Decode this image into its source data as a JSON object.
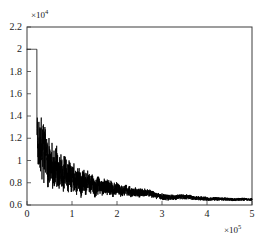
{
  "chart_data": {
    "type": "line",
    "title": "",
    "xlabel": "",
    "ylabel": "",
    "x_exponent_label": "×10",
    "x_exponent_power": "5",
    "y_exponent_label": "×10",
    "y_exponent_power": "4",
    "x_scale_factor": 100000,
    "y_scale_factor": 10000,
    "xlim": [
      0,
      5
    ],
    "ylim": [
      0.6,
      2.2
    ],
    "grid": false,
    "legend": null,
    "legend_position": "none",
    "line_color": "#000000",
    "axis_color": "#3c3c3c",
    "background_color": "#ffffff",
    "xticks": [
      "0",
      "1",
      "2",
      "3",
      "4",
      "5"
    ],
    "xtick_values": [
      0,
      1,
      2,
      3,
      4,
      5
    ],
    "yticks": [
      "0.6",
      "0.8",
      "1",
      "1.2",
      "1.4",
      "1.6",
      "1.8",
      "2",
      "2.2"
    ],
    "ytick_values": [
      0.6,
      0.8,
      1.0,
      1.2,
      1.4,
      1.6,
      1.8,
      2.0,
      2.2
    ],
    "series": [
      {
        "name": "cost",
        "description": "Flat plateau at 2.0 until x=0.22, sharp vertical drop, then noisy decay converging to 0.65",
        "x": [
          0.0,
          0.05,
          0.1,
          0.15,
          0.2,
          0.22,
          0.225,
          0.24,
          0.26,
          0.28,
          0.3,
          0.32,
          0.34,
          0.36,
          0.38,
          0.4,
          0.42,
          0.44,
          0.46,
          0.48,
          0.5,
          0.55,
          0.6,
          0.65,
          0.7,
          0.75,
          0.8,
          0.85,
          0.9,
          0.95,
          1.0,
          1.05,
          1.1,
          1.15,
          1.2,
          1.25,
          1.3,
          1.35,
          1.4,
          1.45,
          1.5,
          1.6,
          1.7,
          1.8,
          1.9,
          2.0,
          2.1,
          2.2,
          2.3,
          2.4,
          2.5,
          2.6,
          2.7,
          2.8,
          2.9,
          3.0,
          3.1,
          3.2,
          3.3,
          3.4,
          3.5,
          3.6,
          3.7,
          3.8,
          3.9,
          4.0,
          4.2,
          4.4,
          4.6,
          4.8,
          5.0
        ],
        "y": [
          2.0,
          2.0,
          2.0,
          2.0,
          2.0,
          2.0,
          1.35,
          1.05,
          0.95,
          1.15,
          1.0,
          1.22,
          0.9,
          1.3,
          0.95,
          1.28,
          1.0,
          1.18,
          0.88,
          1.12,
          0.95,
          1.1,
          0.9,
          1.15,
          0.92,
          1.05,
          0.85,
          1.08,
          0.88,
          1.0,
          0.86,
          1.02,
          0.84,
          0.98,
          0.82,
          0.96,
          0.88,
          1.02,
          0.86,
          0.94,
          0.8,
          0.9,
          0.85,
          0.88,
          0.82,
          0.84,
          0.8,
          0.82,
          0.78,
          0.79,
          0.77,
          0.78,
          0.76,
          0.75,
          0.72,
          0.7,
          0.69,
          0.68,
          0.69,
          0.7,
          0.7,
          0.7,
          0.68,
          0.67,
          0.67,
          0.66,
          0.66,
          0.655,
          0.65,
          0.65,
          0.65
        ],
        "noise_envelope_start": 0.225,
        "noise_envelope_end": 4.2,
        "plateau_value": 2.0,
        "plateau_end_x": 0.22,
        "final_value": 0.65,
        "min_value": 0.63,
        "max_value": 2.0
      }
    ]
  },
  "axes": {
    "frame": {
      "left_px": 27,
      "right_px": 252,
      "top_px": 27,
      "bottom_px": 205
    }
  }
}
